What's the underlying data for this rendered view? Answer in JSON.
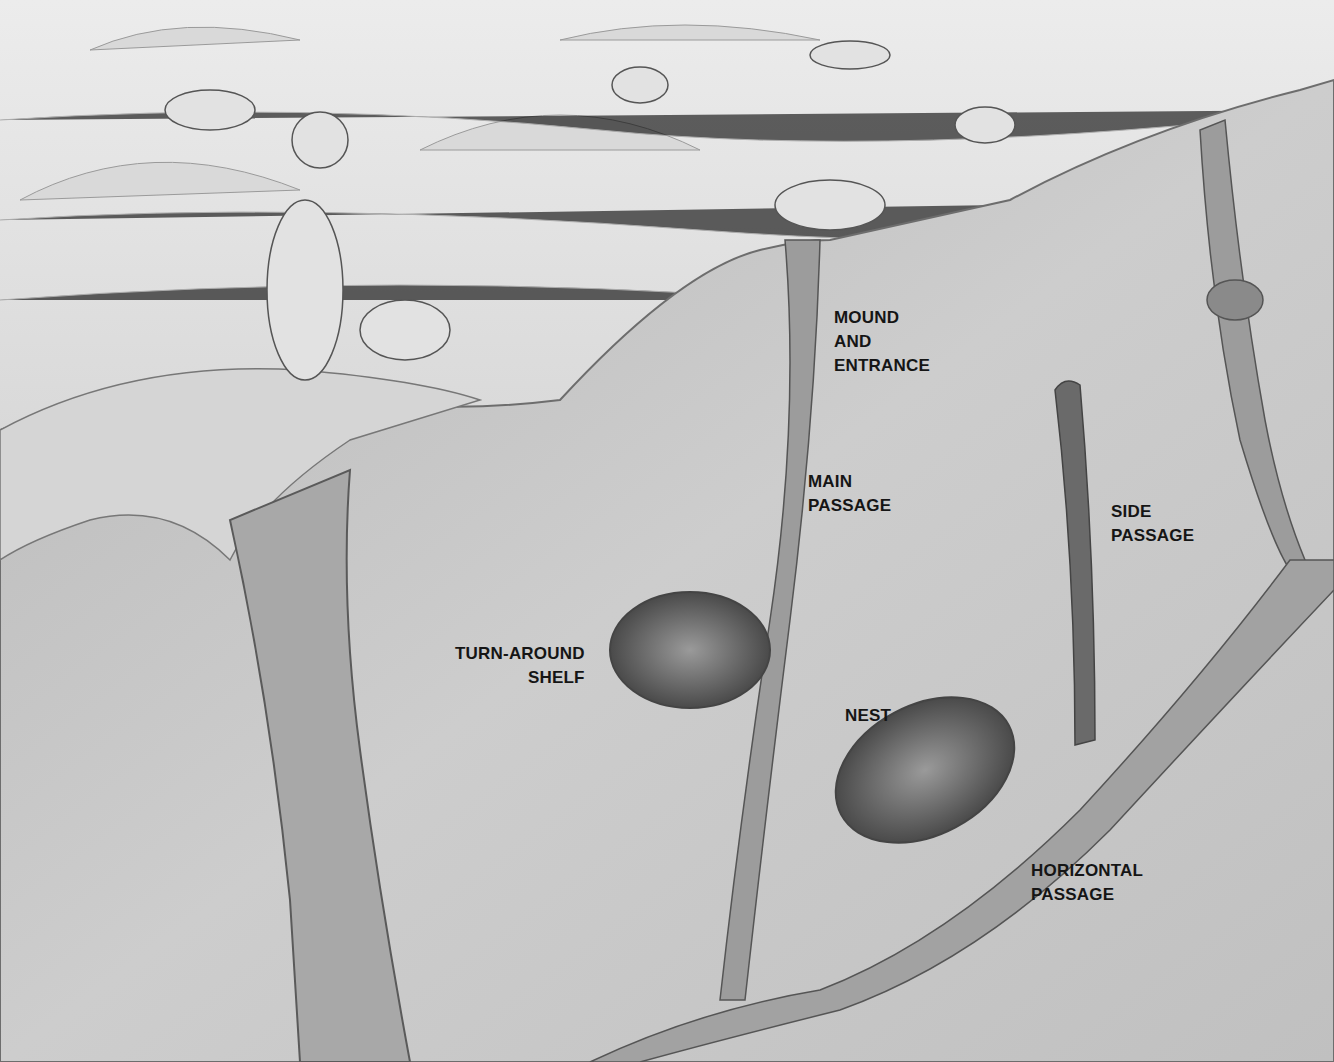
{
  "figure": {
    "style": "grayscale illustration"
  },
  "labels": {
    "mound_entrance": "MOUND\nAND\nENTRANCE",
    "main_passage": "MAIN\nPASSAGE",
    "side_passage": "SIDE\nPASSAGE",
    "turn_around_shelf": "TURN-AROUND\nSHELF",
    "nest": "NEST",
    "horizontal_passage": "HORIZONTAL\nPASSAGE"
  },
  "colors": {
    "sky": "#e6e6e6",
    "grass": "#a9a9a9",
    "soil": "#c4c4c4",
    "tunnel": "#7a7a7a",
    "text": "#151515"
  }
}
